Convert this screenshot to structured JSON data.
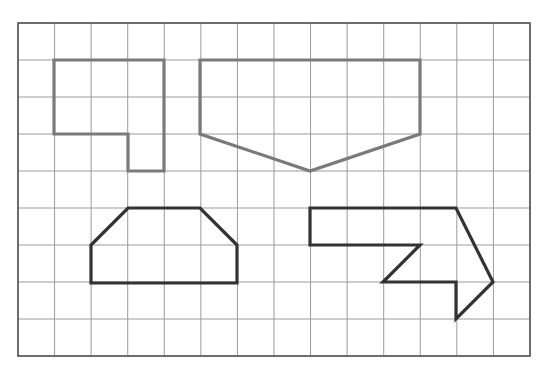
{
  "canvas": {
    "width": 549,
    "height": 386,
    "background": "#ffffff"
  },
  "grid": {
    "label": "square grid",
    "x": 18,
    "y": 23,
    "columns": 14,
    "rows": 9,
    "cell_width": 36.57,
    "cell_height": 37,
    "line_color": "#9a9a9a",
    "border_color": "#555555",
    "line_width": 1,
    "border_width": 1.6
  },
  "shapes": [
    {
      "id": "shape-hexagon-step",
      "name": "step-hexagon",
      "description": "six-sided step shape, top-left of grid",
      "stroke": "#7a7a7a",
      "stroke_width": 3.2,
      "fill": "none",
      "closed": true,
      "points": "54,60 164,60 164,171 128,171 128,134 54,134",
      "vertex_count": 6
    },
    {
      "id": "shape-pentagon-home",
      "name": "home-plate-pentagon",
      "description": "wide pentagon with downward point, top-right of grid",
      "stroke": "#7a7a7a",
      "stroke_width": 3.2,
      "fill": "none",
      "closed": true,
      "points": "200,60 420,60 420,134 310,171 200,134",
      "vertex_count": 5
    },
    {
      "id": "shape-hexagon-trapezoid",
      "name": "trapezoid-hexagon",
      "description": "six-sided house-like shape, bottom-left of grid",
      "stroke": "#333333",
      "stroke_width": 3.2,
      "fill": "none",
      "closed": true,
      "points": "128,208 200,208 237,245 237,283 91,283 91,245",
      "vertex_count": 6
    },
    {
      "id": "shape-arrow",
      "name": "block-arrow",
      "description": "eight-sided arrow pointing right, bottom-right of grid",
      "stroke": "#333333",
      "stroke_width": 3.2,
      "fill": "none",
      "closed": true,
      "points": "310,208 456,208 493,282 456,319 456,282 383,282 420,245 310,245",
      "vertex_count": 8
    }
  ]
}
